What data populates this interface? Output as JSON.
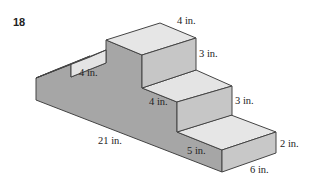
{
  "problem_number": "18",
  "labels": {
    "top_width": "4 in.",
    "top_height": "3 in.",
    "left_step": "4 in.",
    "middle_step": "4 in.",
    "right_height": "3 in.",
    "length": "21 in.",
    "bottom_step": "5 in.",
    "end_height": "2 in.",
    "depth": "6 in."
  },
  "colors": {
    "top_face": "#e6e6e6",
    "front_face": "#a8a8a8",
    "side_face": "#c4c4c4",
    "edge": "#444444"
  }
}
